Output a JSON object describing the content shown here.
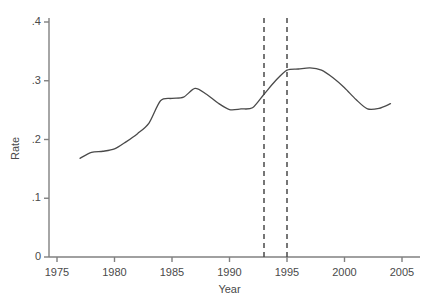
{
  "chart_data": {
    "type": "line",
    "title": "",
    "xlabel": "Year",
    "ylabel": "Rate",
    "xlim": [
      1975,
      2005
    ],
    "ylim": [
      0,
      0.4
    ],
    "grid": false,
    "legend": null,
    "x_ticks": [
      "1975",
      "1980",
      "1985",
      "1990",
      "1995",
      "2000",
      "2005"
    ],
    "x_tick_values": [
      1975,
      1980,
      1985,
      1990,
      1995,
      2000,
      2005
    ],
    "y_ticks": [
      "0",
      ".1",
      ".2",
      ".3",
      ".4"
    ],
    "y_tick_values": [
      0,
      0.1,
      0.2,
      0.3,
      0.4
    ],
    "line_color": "#4a4a4a",
    "axis_color": "#808080",
    "x": [
      1977,
      1978,
      1979,
      1980,
      1981,
      1982,
      1983,
      1984,
      1985,
      1986,
      1987,
      1988,
      1989,
      1990,
      1991,
      1992,
      1993,
      1994,
      1995,
      1996,
      1997,
      1998,
      1999,
      2000,
      2001,
      2002,
      2003,
      2004
    ],
    "values": [
      0.168,
      0.178,
      0.18,
      0.184,
      0.196,
      0.21,
      0.228,
      0.266,
      0.27,
      0.272,
      0.287,
      0.277,
      0.262,
      0.251,
      0.252,
      0.254,
      0.277,
      0.3,
      0.318,
      0.32,
      0.322,
      0.318,
      0.305,
      0.288,
      0.268,
      0.252,
      0.253,
      0.261
    ],
    "series": [
      {
        "name": "Rate",
        "values": [
          0.168,
          0.178,
          0.18,
          0.184,
          0.196,
          0.21,
          0.228,
          0.266,
          0.27,
          0.272,
          0.287,
          0.277,
          0.262,
          0.251,
          0.252,
          0.254,
          0.277,
          0.3,
          0.318,
          0.32,
          0.322,
          0.318,
          0.305,
          0.288,
          0.268,
          0.252,
          0.253,
          0.261
        ]
      }
    ],
    "annotations": [
      {
        "type": "vline",
        "x": 1993,
        "style": "dashed",
        "color": "#4a4a4a"
      },
      {
        "type": "vline",
        "x": 1995,
        "style": "dashed",
        "color": "#4a4a4a"
      }
    ]
  }
}
